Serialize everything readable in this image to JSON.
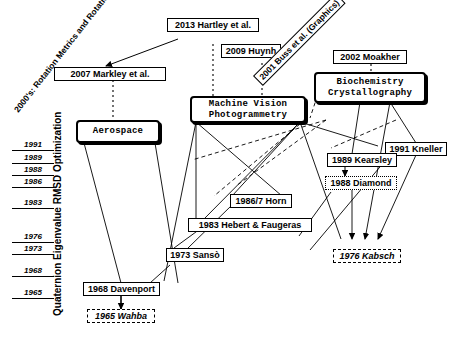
{
  "figure": {
    "title_era_label": "2000's: Rotation Metrics and Rotation Averaging",
    "axis_caption": "Quaternion Eigenvalue RMSD Optimization",
    "background_color": "#ffffff",
    "ink_color": "#000000"
  },
  "timeline": {
    "years": [
      "1991",
      "1989",
      "1988",
      "1986",
      "1983",
      "1976",
      "1973",
      "1968",
      "1965"
    ]
  },
  "nodes": [
    {
      "id": "hartley",
      "label": "2013 Hartley et al.",
      "style": "plain"
    },
    {
      "id": "huynh",
      "label": "2009 Huynh",
      "style": "plain"
    },
    {
      "id": "buss",
      "label": "2001 Buss et al. (Graphics)",
      "style": "plain-rotated"
    },
    {
      "id": "moakher",
      "label": "2002 Moakher",
      "style": "plain"
    },
    {
      "id": "markley",
      "label": "2007 Markley et al.",
      "style": "plain"
    },
    {
      "id": "aerospace",
      "label_line1": "Aerospace",
      "label_line2": "",
      "style": "domain"
    },
    {
      "id": "machinevision",
      "label_line1": "Machine Vision",
      "label_line2": "Photogrammetry",
      "style": "domain"
    },
    {
      "id": "biochem",
      "label_line1": "Biochemistry",
      "label_line2": "Crystallography",
      "style": "domain"
    },
    {
      "id": "kneller",
      "label": "1991 Kneller",
      "style": "plain"
    },
    {
      "id": "kearsley",
      "label": "1989 Kearsley",
      "style": "plain"
    },
    {
      "id": "diamond",
      "label": "1988 Diamond",
      "style": "dotted"
    },
    {
      "id": "horn",
      "label": "1986/7 Horn",
      "style": "plain"
    },
    {
      "id": "hebert",
      "label": "1983 Hebert & Faugeras",
      "style": "plain"
    },
    {
      "id": "sanso",
      "label": "1973 Sansò",
      "style": "plain"
    },
    {
      "id": "davenport",
      "label": "1968 Davenport",
      "style": "plain"
    },
    {
      "id": "kabsch",
      "label": "1976  Kabsch",
      "style": "dashed"
    },
    {
      "id": "wahba",
      "label": "1965  Wahba",
      "style": "dashed"
    }
  ]
}
